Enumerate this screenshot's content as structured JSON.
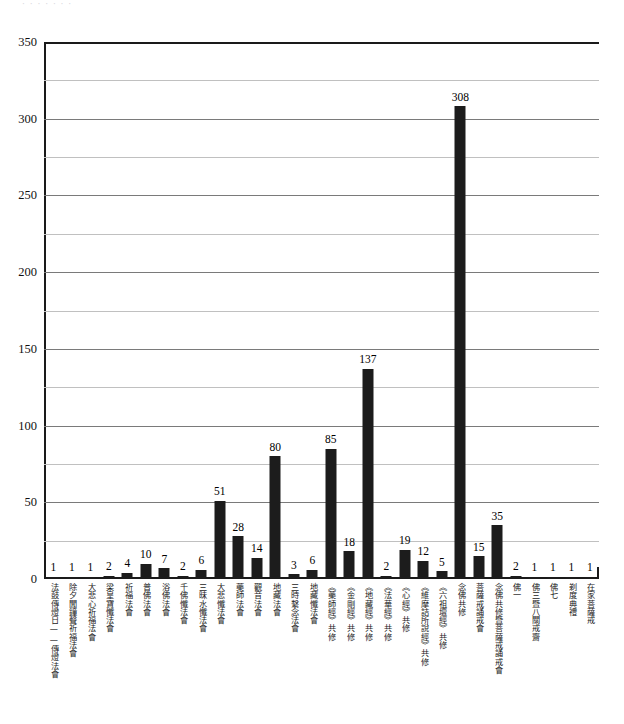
{
  "scan": {
    "clipped_header_text": "· · · · · · ·"
  },
  "chart_data": {
    "type": "bar",
    "title": "",
    "subtitle": "",
    "xlabel": "",
    "ylabel": "",
    "ylim": [
      0,
      350
    ],
    "y_ticks": [
      0,
      50,
      100,
      150,
      200,
      250,
      300,
      350
    ],
    "y_minor_ticks": [
      25,
      75,
      125,
      175,
      225,
      275,
      325
    ],
    "grid": true,
    "legend": false,
    "legend_position": "none",
    "bar_color": "#1c1c1c",
    "data_labels": true,
    "categories": [
      "法鼓傳燈日——傳燈法會",
      "除夕聞鐘聲祈福法會",
      "大悲心祈福法會",
      "梁皇寶懺法會",
      "祈福法會",
      "普佛法會",
      "浴佛法會",
      "千佛懺法會",
      "三昧水懺法會",
      "大悲懺法會",
      "藥師法會",
      "觀音法會",
      "地藏法會",
      "三時繫念法會",
      "地藏懺法會",
      "《藥師經》共修",
      "《金剛經》共修",
      "《地藏經》共修",
      "《法華經》共修",
      "《心經》共修",
      "《維摩詰所說經》共修",
      "《六祖壇經》共修",
      "念佛共修",
      "菩薩戒誦戒會",
      "念佛共修暨菩薩戒誦戒會",
      "佛一",
      "佛三暨八關戒齋",
      "佛七",
      "剃度典禮",
      "在家菩薩戒"
    ],
    "values": [
      1,
      1,
      1,
      2,
      4,
      10,
      7,
      2,
      6,
      51,
      28,
      14,
      80,
      3,
      6,
      85,
      18,
      137,
      2,
      19,
      12,
      5,
      308,
      15,
      35,
      2,
      1,
      1,
      1,
      1
    ]
  }
}
